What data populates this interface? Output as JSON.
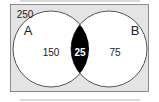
{
  "diagram": {
    "type": "venn",
    "universe_label": "250",
    "sets": [
      {
        "name": "A",
        "only_value": "150"
      },
      {
        "name": "B",
        "only_value": "75"
      }
    ],
    "intersection_value": "25",
    "colors": {
      "frame_fill": "#e4e4e4",
      "frame_stroke": "#8a8a8a",
      "circle_fill": "#ffffff",
      "circle_stroke": "#555555",
      "intersection_fill": "#000000",
      "intersection_text": "#ffffff"
    }
  }
}
